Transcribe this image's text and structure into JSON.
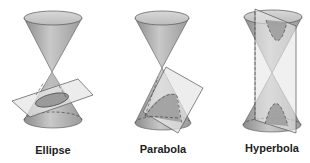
{
  "figure": {
    "panels": [
      {
        "id": "ellipse",
        "label": "Ellipse"
      },
      {
        "id": "parabola",
        "label": "Parabola"
      },
      {
        "id": "hyperbola",
        "label": "Hyperbola"
      }
    ]
  },
  "colors": {
    "background": "#ffffff",
    "cone_fill": "#b8b8b8",
    "cone_dark": "#8f8f8f",
    "cone_light": "#d9d9d9",
    "plane_fill": "#e6e6e6",
    "section_fill": "#9a9a9a",
    "stroke": "#555555",
    "label": "#222222"
  }
}
